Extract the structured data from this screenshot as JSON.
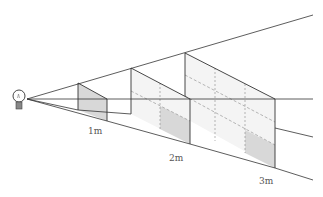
{
  "diagram": {
    "labels": {
      "d1": "1m",
      "d2": "2m",
      "d3": "3m"
    },
    "icons": {
      "source": "light-bulb-icon"
    },
    "frames": [
      {
        "distance": "1m",
        "grid": "1x1",
        "shaded_cells": 1
      },
      {
        "distance": "2m",
        "grid": "2x2",
        "shaded_cells": 1
      },
      {
        "distance": "3m",
        "grid": "3x3",
        "shaded_cells": 1
      }
    ],
    "colors": {
      "line": "#333333",
      "panel_fill": "#f2f2f2",
      "shaded_fill": "#d6d6d6",
      "dashed": "#888888",
      "label": "#555555"
    }
  }
}
